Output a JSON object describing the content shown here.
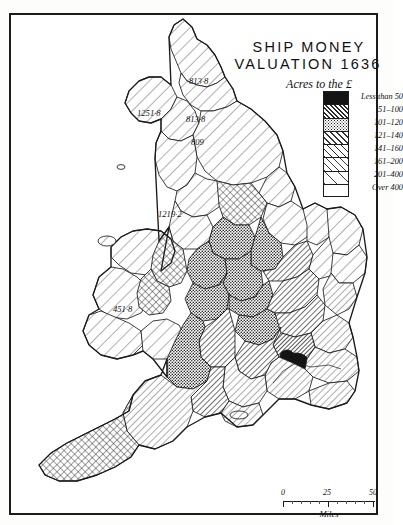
{
  "title": {
    "line1": "SHIP MONEY",
    "line2": "VALUATION 1636"
  },
  "legend": {
    "heading": "Acres to the £",
    "items": [
      {
        "label": "Less than 50",
        "pattern": "solid-black",
        "color": "#1a1a1a"
      },
      {
        "label": "51–100",
        "pattern": "dense-diagonal",
        "color": "#3a3a3a"
      },
      {
        "label": "101–120",
        "pattern": "dense-stipple",
        "color": "#555555"
      },
      {
        "label": "121–140",
        "pattern": "medium-diagonal",
        "color": "#6a6a6a"
      },
      {
        "label": "141–160",
        "pattern": "crosshatch",
        "color": "#7a7a7a"
      },
      {
        "label": "161–200",
        "pattern": "light-diagonal",
        "color": "#9a9a9a"
      },
      {
        "label": "201–400",
        "pattern": "sparse-diagonal",
        "color": "#c0c0c0"
      },
      {
        "label": "Over 400",
        "pattern": "blank",
        "color": "#ffffff"
      }
    ]
  },
  "map_labels": [
    {
      "text": "813·8",
      "x": 188,
      "y": 66
    },
    {
      "text": "1251·8",
      "x": 138,
      "y": 98
    },
    {
      "text": "813·8",
      "x": 185,
      "y": 104
    },
    {
      "text": "809",
      "x": 188,
      "y": 127
    },
    {
      "text": "1219·2",
      "x": 157,
      "y": 199
    },
    {
      "text": "451·8",
      "x": 112,
      "y": 294
    }
  ],
  "scale": {
    "ticks": [
      "0",
      "25",
      "50"
    ],
    "unit": "Miles"
  },
  "colors": {
    "ink": "#1b1b1b",
    "paper": "#ffffff"
  }
}
